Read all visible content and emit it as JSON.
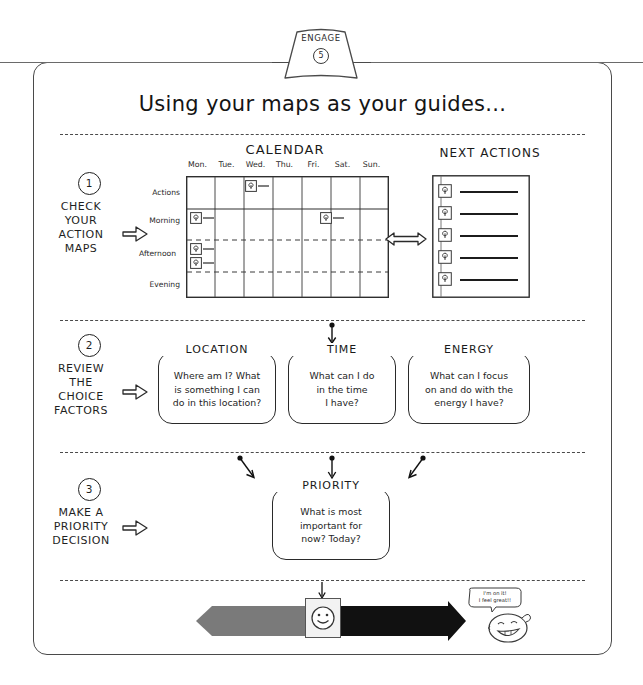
{
  "banner": {
    "label": "ENGAGE",
    "number": "5"
  },
  "title": "Using your maps as your guides...",
  "steps": [
    {
      "number": "1",
      "label": "CHECK\nYOUR\nACTION\nMAPS"
    },
    {
      "number": "2",
      "label": "REVIEW\nTHE\nCHOICE\nFACTORS"
    },
    {
      "number": "3",
      "label": "MAKE A\nPRIORITY\nDECISION"
    }
  ],
  "calendar": {
    "title": "CALENDAR",
    "days": [
      "Mon.",
      "Tue.",
      "Wed.",
      "Thu.",
      "Fri.",
      "Sat.",
      "Sun."
    ],
    "rows": [
      "Actions",
      "Morning",
      "Afternoon",
      "Evening"
    ],
    "entries": [
      {
        "row": "Actions",
        "day": "Wed."
      },
      {
        "row": "Morning",
        "day": "Mon."
      },
      {
        "row": "Morning",
        "day": "Sat."
      },
      {
        "row": "Afternoon",
        "day": "Mon."
      },
      {
        "row": "Afternoon",
        "day": "Mon."
      }
    ]
  },
  "next_actions": {
    "title": "NEXT ACTIONS",
    "item_count": 5,
    "icon": "location-pin-icon"
  },
  "choice_factors": [
    {
      "title": "LOCATION",
      "body": "Where am I? What\nis something I can\ndo in this location?"
    },
    {
      "title": "TIME",
      "body": "What can I do\nin the time\nI have?"
    },
    {
      "title": "ENERGY",
      "body": "What can I focus\non and do with the\nenergy I have?"
    }
  ],
  "priority": {
    "title": "PRIORITY",
    "body": "What is most\nimportant for\nnow? Today?"
  },
  "action_bar": {
    "left_label": "ACTION",
    "right_label": "MOMENTUM",
    "center_icon": "smiley-face-icon",
    "left_color": "#7a7a7a",
    "right_color": "#111111"
  },
  "mascot": {
    "speech": "I'm on it!\nI feel great!!",
    "icon": "smiling-face-icon"
  },
  "colors": {
    "ink": "#1a1a1a",
    "frame": "#4a4a4a",
    "paper": "#ffffff"
  }
}
